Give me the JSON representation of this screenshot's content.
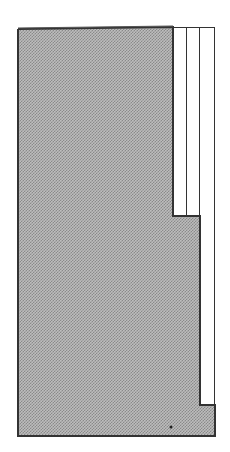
{
  "figure": {
    "colors": {
      "panel_fill": "#bdbdbd",
      "dither": "#8a8a8a",
      "outline": "#333333",
      "strip_fill": "#ffffff"
    },
    "strips": [
      {
        "label": ""
      },
      {
        "label": ""
      },
      {
        "label": ""
      }
    ]
  }
}
